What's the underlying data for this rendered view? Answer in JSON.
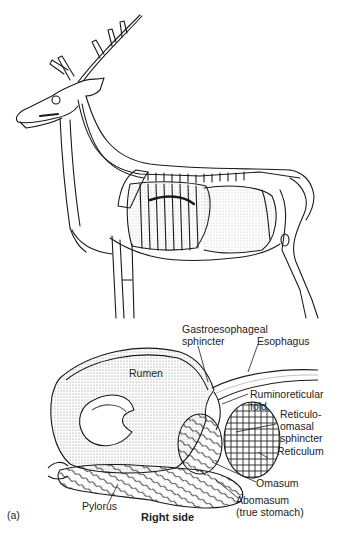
{
  "figure": {
    "panel_label": "(a)",
    "view_label": "Right side",
    "top_illustration": "deer-skeleton-with-digestive-organs",
    "labels": {
      "gastroesophageal_sphincter": [
        "Gastroesophageal",
        "sphincter"
      ],
      "esophagus": "Esophagus",
      "rumen": "Rumen",
      "ruminoreticular_fold": [
        "Ruminoreticular",
        "fold"
      ],
      "reticulo_omasal_sphincter": [
        "Reticulo-",
        "omasal",
        "sphincter"
      ],
      "reticulum": "Reticulum",
      "omasum": "Omasum",
      "abomasum": [
        "Abomasum",
        "(true stomach)"
      ],
      "pylorus": "Pylorus"
    }
  },
  "colors": {
    "line": "#1a1a1a",
    "stipple": "#8a8a8a",
    "background": "#ffffff"
  }
}
